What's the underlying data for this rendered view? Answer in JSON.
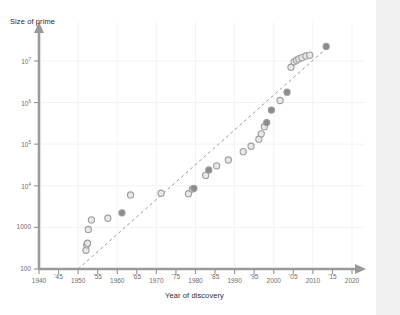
{
  "chart_data": {
    "type": "scatter",
    "title": "",
    "xlabel": "Year of discovery",
    "ylabel": "Size of prime",
    "xlim": [
      1940,
      2020
    ],
    "ylim_log10": [
      2,
      7.6
    ],
    "yscale": "log",
    "grid": true,
    "legend": "none",
    "xticks": [
      {
        "value": 1940,
        "label": "1940"
      },
      {
        "value": 1945,
        "label": "'45"
      },
      {
        "value": 1950,
        "label": "1950"
      },
      {
        "value": 1955,
        "label": "'55"
      },
      {
        "value": 1960,
        "label": "1960"
      },
      {
        "value": 1965,
        "label": "'65"
      },
      {
        "value": 1970,
        "label": "1970"
      },
      {
        "value": 1975,
        "label": "'75"
      },
      {
        "value": 1980,
        "label": "1980"
      },
      {
        "value": 1985,
        "label": "'85"
      },
      {
        "value": 1990,
        "label": "1990"
      },
      {
        "value": 1995,
        "label": "'95"
      },
      {
        "value": 2000,
        "label": "2000"
      },
      {
        "value": 2005,
        "label": "'05"
      },
      {
        "value": 2010,
        "label": "2010"
      },
      {
        "value": 2015,
        "label": "'15"
      },
      {
        "value": 2020,
        "label": "2020"
      }
    ],
    "yticks": [
      {
        "exp": 2,
        "base": "100",
        "sup": ""
      },
      {
        "exp": 3,
        "base": "1000",
        "sup": ""
      },
      {
        "exp": 4,
        "base": "10",
        "sup": "4"
      },
      {
        "exp": 5,
        "base": "10",
        "sup": "5"
      },
      {
        "exp": 6,
        "base": "10",
        "sup": "6"
      },
      {
        "exp": 7,
        "base": "10",
        "sup": "7"
      }
    ],
    "trendline": {
      "style": "dashed",
      "x_start": 1950,
      "y_start_log10": 2.0,
      "x_end": 2014,
      "y_end_log10": 7.35
    },
    "series": [
      {
        "name": "Mersenne primes",
        "marker": "circle",
        "points": [
          {
            "x": 1952.0,
            "y_log10": 2.45,
            "filled": false
          },
          {
            "x": 1952.2,
            "y_log10": 2.58,
            "filled": false
          },
          {
            "x": 1952.4,
            "y_log10": 2.62,
            "filled": false
          },
          {
            "x": 1952.6,
            "y_log10": 2.95,
            "filled": false
          },
          {
            "x": 1953.4,
            "y_log10": 3.18,
            "filled": false
          },
          {
            "x": 1957.6,
            "y_log10": 3.22,
            "filled": false
          },
          {
            "x": 1961.2,
            "y_log10": 3.35,
            "filled": true
          },
          {
            "x": 1963.4,
            "y_log10": 3.78,
            "filled": false
          },
          {
            "x": 1971.2,
            "y_log10": 3.82,
            "filled": false
          },
          {
            "x": 1978.2,
            "y_log10": 3.81,
            "filled": false
          },
          {
            "x": 1979.2,
            "y_log10": 3.92,
            "filled": false
          },
          {
            "x": 1979.6,
            "y_log10": 3.94,
            "filled": true
          },
          {
            "x": 1982.6,
            "y_log10": 4.25,
            "filled": false
          },
          {
            "x": 1983.4,
            "y_log10": 4.38,
            "filled": true
          },
          {
            "x": 1985.4,
            "y_log10": 4.48,
            "filled": false
          },
          {
            "x": 1988.4,
            "y_log10": 4.62,
            "filled": false
          },
          {
            "x": 1992.2,
            "y_log10": 4.82,
            "filled": false
          },
          {
            "x": 1994.2,
            "y_log10": 4.95,
            "filled": false
          },
          {
            "x": 1996.2,
            "y_log10": 5.12,
            "filled": false
          },
          {
            "x": 1996.8,
            "y_log10": 5.25,
            "filled": false
          },
          {
            "x": 1997.6,
            "y_log10": 5.42,
            "filled": false
          },
          {
            "x": 1998.2,
            "y_log10": 5.52,
            "filled": true
          },
          {
            "x": 1999.4,
            "y_log10": 5.82,
            "filled": true
          },
          {
            "x": 2001.6,
            "y_log10": 6.05,
            "filled": false
          },
          {
            "x": 2003.4,
            "y_log10": 6.25,
            "filled": true
          },
          {
            "x": 2004.4,
            "y_log10": 6.85,
            "filled": false
          },
          {
            "x": 2005.2,
            "y_log10": 6.98,
            "filled": false
          },
          {
            "x": 2005.8,
            "y_log10": 7.02,
            "filled": false
          },
          {
            "x": 2006.4,
            "y_log10": 7.05,
            "filled": false
          },
          {
            "x": 2007.2,
            "y_log10": 7.08,
            "filled": false
          },
          {
            "x": 2008.2,
            "y_log10": 7.12,
            "filled": false
          },
          {
            "x": 2009.2,
            "y_log10": 7.14,
            "filled": false
          },
          {
            "x": 2013.4,
            "y_log10": 7.35,
            "filled": true
          }
        ]
      }
    ]
  },
  "style": {
    "axis_color": "#9a9a9a",
    "grid_color": "#f3f3f3",
    "marker_stroke": "#9d9d9d",
    "marker_fill_light": "#e8e8e8",
    "marker_fill_dark": "#8c8c8c",
    "trend_color": "#9a9a9a",
    "text_color": "#6d6d6d",
    "title_color": "#2b2b2b",
    "gutter_color": "#f0f0f0"
  }
}
